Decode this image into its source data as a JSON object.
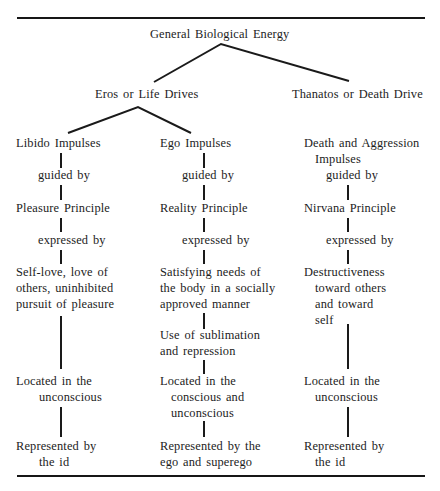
{
  "diagram": {
    "root": "General Biological Energy",
    "branches": {
      "eros": "Eros or Life Drives",
      "thanatos": "Thanatos or Death Drive"
    },
    "columns": {
      "libido": {
        "impulse": "Libido Impulses",
        "guided_by": "guided by",
        "principle": "Pleasure Principle",
        "expressed_by": "expressed by",
        "expression": [
          "Self-love, love of",
          "others, uninhibited",
          "pursuit of pleasure"
        ],
        "located": [
          "Located in the",
          "unconscious"
        ],
        "represented": [
          "Represented by",
          "the id"
        ]
      },
      "ego": {
        "impulse": "Ego Impulses",
        "guided_by": "guided by",
        "principle": "Reality Principle",
        "expressed_by": "expressed by",
        "expression": [
          "Satisfying needs of",
          "the body in a socially",
          "approved manner"
        ],
        "mechanism": [
          "Use of sublimation",
          "and repression"
        ],
        "located": [
          "Located in the",
          "conscious and",
          "unconscious"
        ],
        "represented": [
          "Represented by the",
          "ego and superego"
        ]
      },
      "death": {
        "impulse": [
          "Death and Aggression",
          "Impulses"
        ],
        "guided_by": "guided by",
        "principle": "Nirvana Principle",
        "expressed_by": "expressed by",
        "expression": [
          "Destructiveness",
          "toward others",
          "and toward",
          "self"
        ],
        "located": [
          "Located in the",
          "unconscious"
        ],
        "represented": [
          "Represented by",
          "the id"
        ]
      }
    }
  }
}
